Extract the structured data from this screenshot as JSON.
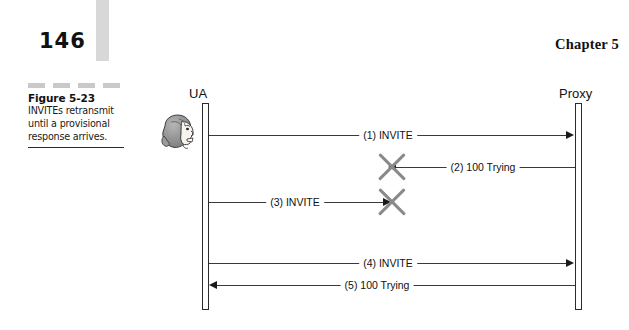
{
  "page": {
    "number": "146",
    "chapter_label": "Chapter 5"
  },
  "caption": {
    "title": "Figure 5-23",
    "text": "INVITEs retransmit until a provisional response arrives."
  },
  "diagram": {
    "type": "sequence-diagram",
    "actors": [
      {
        "id": "ua",
        "label": "UA",
        "x": 205,
        "icon": "user-head-icon"
      },
      {
        "id": "proxy",
        "label": "Proxy",
        "x": 578,
        "icon": null
      }
    ],
    "lifeline": {
      "top": 103,
      "bottom": 310
    },
    "messages": [
      {
        "seq": "1",
        "label": "(1) INVITE",
        "from": "ua",
        "to": "proxy",
        "direction": "right",
        "y": 135,
        "lost": false
      },
      {
        "seq": "2",
        "label": "(2) 100 Trying",
        "from": "proxy",
        "to": "ua",
        "direction": "left",
        "y": 167,
        "lost": true,
        "loss_x": 392
      },
      {
        "seq": "3",
        "label": "(3) INVITE",
        "from": "ua",
        "to": "proxy",
        "direction": "right",
        "y": 202,
        "lost": true,
        "loss_x": 392
      },
      {
        "seq": "4",
        "label": "(4) INVITE",
        "from": "ua",
        "to": "proxy",
        "direction": "right",
        "y": 263,
        "lost": false
      },
      {
        "seq": "5",
        "label": "(5) 100 Trying",
        "from": "proxy",
        "to": "ua",
        "direction": "left",
        "y": 285,
        "lost": false
      }
    ]
  },
  "colors": {
    "line": "#3a3a3a",
    "loss_marker": "#8a8a8a",
    "gray_bar": "#d8d8d8",
    "caption_rule": "#c9c9c9"
  }
}
